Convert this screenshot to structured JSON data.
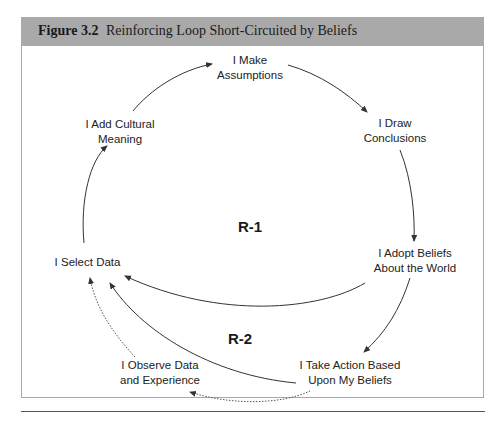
{
  "figure": {
    "label": "Figure 3.2",
    "title": "Reinforcing Loop Short-Circuited by Beliefs"
  },
  "nodes": {
    "make_assumptions": [
      "I Make",
      "Assumptions"
    ],
    "draw_conclusions": [
      "I Draw",
      "Conclusions"
    ],
    "adopt_beliefs": [
      "I Adopt Beliefs",
      "About the World"
    ],
    "take_action": [
      "I Take Action Based",
      "Upon My Beliefs"
    ],
    "observe_data": [
      "I Observe Data",
      "and Experience"
    ],
    "select_data": [
      "I Select Data"
    ],
    "add_meaning": [
      "I Add Cultural",
      "Meaning"
    ]
  },
  "loops": {
    "r1": "R-1",
    "r2": "R-2"
  },
  "colors": {
    "header_bg": "#a9a9a9",
    "line": "#333333",
    "frame": "#a8a8a8"
  }
}
